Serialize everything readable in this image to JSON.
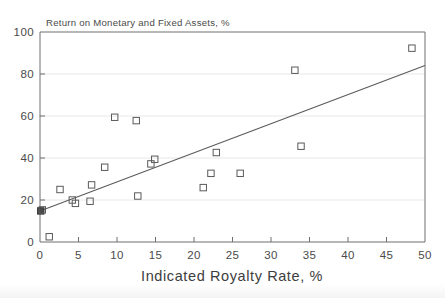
{
  "chart_data": {
    "type": "scatter",
    "title": "Return on Monetary and Fixed Assets, %",
    "xlabel": "Indicated Royalty Rate, %",
    "ylabel": "",
    "xlim": [
      0,
      50
    ],
    "ylim": [
      0,
      100
    ],
    "xticks": [
      0,
      5,
      10,
      15,
      20,
      25,
      30,
      35,
      40,
      45,
      50
    ],
    "yticks": [
      0,
      20,
      40,
      60,
      80,
      100
    ],
    "xtick_labels": [
      "0",
      "5",
      "10",
      "15",
      "20",
      "25",
      "30",
      "35",
      "40",
      "45",
      "50"
    ],
    "ytick_labels": [
      "0",
      "20",
      "40",
      "60",
      "80",
      "100"
    ],
    "grid": "horizontal",
    "legend": "none",
    "marker": "open-square",
    "points": [
      {
        "x": 0.1,
        "y": 14.8,
        "style": "filled"
      },
      {
        "x": 0.3,
        "y": 15.3,
        "style": "open"
      },
      {
        "x": 1.2,
        "y": 2.5,
        "style": "open"
      },
      {
        "x": 2.6,
        "y": 25.0,
        "style": "open"
      },
      {
        "x": 4.2,
        "y": 20.0,
        "style": "open"
      },
      {
        "x": 4.6,
        "y": 18.4,
        "style": "open"
      },
      {
        "x": 6.5,
        "y": 19.4,
        "style": "open"
      },
      {
        "x": 6.7,
        "y": 27.2,
        "style": "open"
      },
      {
        "x": 8.4,
        "y": 35.6,
        "style": "open"
      },
      {
        "x": 9.7,
        "y": 59.4,
        "style": "open"
      },
      {
        "x": 12.5,
        "y": 57.8,
        "style": "open"
      },
      {
        "x": 12.7,
        "y": 21.9,
        "style": "open"
      },
      {
        "x": 14.4,
        "y": 37.2,
        "style": "open"
      },
      {
        "x": 14.9,
        "y": 39.4,
        "style": "open"
      },
      {
        "x": 21.2,
        "y": 25.9,
        "style": "open"
      },
      {
        "x": 22.2,
        "y": 32.7,
        "style": "open"
      },
      {
        "x": 22.9,
        "y": 42.6,
        "style": "open"
      },
      {
        "x": 26.0,
        "y": 32.7,
        "style": "open"
      },
      {
        "x": 33.1,
        "y": 81.8,
        "style": "open"
      },
      {
        "x": 33.9,
        "y": 45.6,
        "style": "open"
      },
      {
        "x": 48.3,
        "y": 92.3,
        "style": "open"
      }
    ],
    "trendline": {
      "label": "fitted regression line",
      "x0": 0.0,
      "y0": 14.8,
      "x1": 50.0,
      "y1": 84.0
    }
  }
}
